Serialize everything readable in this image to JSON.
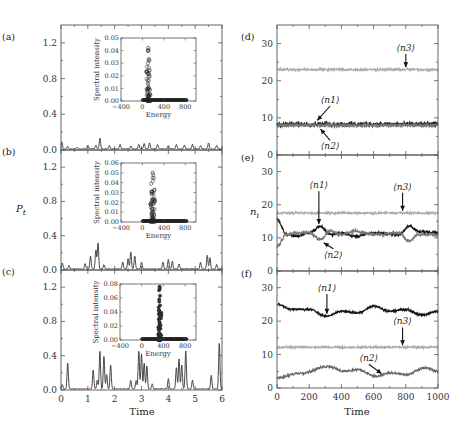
{
  "chart_data": [
    {
      "id": "a",
      "panel_label": "(a)",
      "type": "line",
      "xlabel": "",
      "ylabel": "P_t",
      "xlim": [
        0,
        6
      ],
      "ylim": [
        0,
        1.4
      ],
      "yticks": [
        0.0,
        0.4,
        0.8,
        1.2
      ],
      "xticks": [
        0,
        1,
        2,
        3,
        4,
        5,
        6
      ],
      "series": [
        {
          "name": "P_t",
          "color": "#333333",
          "peaks": [
            [
              0.03,
              0.08
            ],
            [
              0.25,
              0.03
            ],
            [
              0.6,
              0.02
            ],
            [
              1.0,
              0.04
            ],
            [
              1.3,
              0.04
            ],
            [
              1.45,
              0.12
            ],
            [
              1.8,
              0.04
            ],
            [
              2.2,
              0.05
            ],
            [
              2.6,
              0.03
            ],
            [
              2.9,
              0.05
            ],
            [
              3.1,
              0.06
            ],
            [
              3.3,
              0.07
            ],
            [
              3.6,
              0.05
            ],
            [
              4.0,
              0.04
            ],
            [
              4.3,
              0.05
            ],
            [
              4.6,
              0.04
            ],
            [
              4.9,
              0.05
            ],
            [
              5.2,
              0.04
            ],
            [
              5.5,
              0.07
            ],
            [
              5.8,
              0.04
            ]
          ]
        }
      ],
      "inset": {
        "xlabel": "Energy",
        "ylabel": "Spectral intensity",
        "xlim": [
          -400,
          1000
        ],
        "ylim": [
          0,
          0.05
        ],
        "xticks": [
          -400,
          0,
          400,
          800
        ],
        "xtick_labels": [
          "−400",
          "0",
          "400",
          "800"
        ],
        "yticks": [
          0.0,
          0.01,
          0.02,
          0.03,
          0.04,
          0.05
        ],
        "ytick_labels": [
          "0.00",
          "0.01",
          "0.02",
          "0.03",
          "0.04",
          "0.05"
        ],
        "marker": "open-circle",
        "center": 110,
        "spread": 60,
        "max": 0.042,
        "tail_to": 830
      }
    },
    {
      "id": "b",
      "panel_label": "(b)",
      "type": "line",
      "xlabel": "",
      "ylabel": "P_t",
      "xlim": [
        0,
        6
      ],
      "ylim": [
        0,
        1.4
      ],
      "yticks": [
        0.0,
        0.4,
        0.8,
        1.2
      ],
      "xticks": [
        0,
        1,
        2,
        3,
        4,
        5,
        6
      ],
      "series": [
        {
          "name": "P_t",
          "color": "#333333",
          "peaks": [
            [
              0.05,
              0.07
            ],
            [
              0.3,
              0.04
            ],
            [
              0.9,
              0.06
            ],
            [
              1.1,
              0.15
            ],
            [
              1.3,
              0.22
            ],
            [
              1.38,
              0.3
            ],
            [
              1.6,
              0.05
            ],
            [
              2.3,
              0.08
            ],
            [
              2.5,
              0.12
            ],
            [
              2.6,
              0.2
            ],
            [
              2.75,
              0.15
            ],
            [
              3.0,
              0.08
            ],
            [
              3.8,
              0.08
            ],
            [
              4.0,
              0.11
            ],
            [
              4.15,
              0.09
            ],
            [
              4.4,
              0.06
            ],
            [
              5.2,
              0.08
            ],
            [
              5.45,
              0.16
            ],
            [
              5.55,
              0.13
            ],
            [
              5.8,
              0.05
            ]
          ]
        }
      ],
      "inset": {
        "xlabel": "Energy",
        "ylabel": "Spectral intensity",
        "xlim": [
          -400,
          1000
        ],
        "ylim": [
          0,
          0.06
        ],
        "xticks": [
          -400,
          0,
          400,
          800
        ],
        "xtick_labels": [
          "−400",
          "0",
          "400",
          "800"
        ],
        "yticks": [
          0.0,
          0.01,
          0.02,
          0.03,
          0.04,
          0.05,
          0.06
        ],
        "ytick_labels": [
          "0.00",
          "0.01",
          "0.02",
          "0.03",
          "0.04",
          "0.05",
          "0.06"
        ],
        "marker": "open-circle",
        "center": 190,
        "spread": 60,
        "max": 0.05,
        "tail_to": 830
      }
    },
    {
      "id": "c",
      "panel_label": "(c)",
      "type": "line",
      "xlabel": "Time",
      "ylabel": "P_t",
      "xlim": [
        0,
        6
      ],
      "ylim": [
        0,
        1.4
      ],
      "yticks": [
        0.0,
        0.4,
        0.8,
        1.2
      ],
      "xticks": [
        0,
        1,
        2,
        3,
        4,
        5,
        6
      ],
      "series": [
        {
          "name": "P_t",
          "color": "#333333",
          "peaks": [
            [
              0.05,
              0.05
            ],
            [
              0.25,
              0.3
            ],
            [
              1.2,
              0.22
            ],
            [
              1.35,
              0.1
            ],
            [
              1.45,
              0.44
            ],
            [
              1.6,
              0.38
            ],
            [
              1.7,
              0.17
            ],
            [
              1.85,
              0.28
            ],
            [
              2.6,
              0.1
            ],
            [
              2.8,
              0.1
            ],
            [
              2.9,
              0.44
            ],
            [
              3.0,
              0.41
            ],
            [
              3.1,
              0.3
            ],
            [
              3.2,
              0.27
            ],
            [
              3.4,
              0.06
            ],
            [
              4.0,
              0.12
            ],
            [
              4.3,
              0.25
            ],
            [
              4.4,
              0.35
            ],
            [
              4.5,
              0.28
            ],
            [
              4.65,
              0.44
            ],
            [
              4.9,
              0.1
            ],
            [
              5.6,
              0.16
            ],
            [
              5.9,
              0.53
            ]
          ]
        }
      ],
      "inset": {
        "xlabel": "Energy",
        "ylabel": "Spectral intensity",
        "xlim": [
          -400,
          1000
        ],
        "ylim": [
          0,
          0.08
        ],
        "xticks": [
          -400,
          0,
          400,
          800
        ],
        "xtick_labels": [
          "−400",
          "0",
          "400",
          "800"
        ],
        "yticks": [
          0.0,
          0.02,
          0.04,
          0.06,
          0.08
        ],
        "ytick_labels": [
          "0.00",
          "0.02",
          "0.04",
          "0.06",
          "0.08"
        ],
        "marker": "filled-circle",
        "center": 330,
        "spread": 40,
        "max": 0.076,
        "tail_to": 830
      }
    },
    {
      "id": "d",
      "panel_label": "(d)",
      "type": "line",
      "xlabel": "",
      "ylabel": "n_i",
      "xlim": [
        0,
        1000
      ],
      "ylim": [
        0,
        35
      ],
      "yticks": [
        0,
        10,
        20,
        30
      ],
      "xticks": [
        0,
        200,
        400,
        600,
        800,
        1000
      ],
      "series": [
        {
          "name": "⟨n1⟩",
          "color": "#222222",
          "mean": 8.3,
          "noise": 1.0,
          "waves": []
        },
        {
          "name": "⟨n2⟩",
          "color": "#777777",
          "mean": 8.0,
          "noise": 0.8,
          "waves": []
        },
        {
          "name": "⟨n3⟩",
          "color": "#aaaaaa",
          "mean": 23.0,
          "noise": 0.5,
          "waves": []
        }
      ],
      "annotations": [
        {
          "text": "⟨n3⟩",
          "x": 800,
          "y": 28,
          "arrow_to": [
            800,
            23.6
          ]
        },
        {
          "text": "⟨n1⟩",
          "x": 330,
          "y": 14,
          "arrow_to": [
            250,
            9.3
          ]
        },
        {
          "text": "⟨n2⟩",
          "x": 330,
          "y": 1.5,
          "arrow_to": [
            270,
            7.0
          ]
        }
      ]
    },
    {
      "id": "e",
      "panel_label": "(e)",
      "type": "line",
      "xlabel": "",
      "ylabel": "n_i",
      "xlim": [
        0,
        1000
      ],
      "ylim": [
        0,
        35
      ],
      "yticks": [
        0,
        10,
        20,
        30
      ],
      "xticks": [
        0,
        200,
        400,
        600,
        800,
        1000
      ],
      "series": [
        {
          "name": "⟨n1⟩",
          "color": "#111111",
          "mean": 11.5,
          "noise": 0.7,
          "waves": [
            [
              0,
              15.5
            ],
            [
              60,
              11
            ],
            [
              120,
              10.5
            ],
            [
              200,
              11.5
            ],
            [
              270,
              13.5
            ],
            [
              330,
              11
            ],
            [
              400,
              11.5
            ],
            [
              480,
              10.5
            ],
            [
              600,
              11.5
            ],
            [
              760,
              11
            ],
            [
              820,
              13.5
            ],
            [
              880,
              12
            ],
            [
              1000,
              11.5
            ]
          ]
        },
        {
          "name": "⟨n2⟩",
          "color": "#777777",
          "mean": 11.0,
          "noise": 0.8,
          "waves": [
            [
              0,
              7.5
            ],
            [
              60,
              11
            ],
            [
              120,
              11.5
            ],
            [
              200,
              11.5
            ],
            [
              270,
              9.5
            ],
            [
              330,
              12
            ],
            [
              400,
              11
            ],
            [
              480,
              12
            ],
            [
              600,
              11
            ],
            [
              760,
              11.5
            ],
            [
              820,
              9
            ],
            [
              880,
              11
            ],
            [
              1000,
              11
            ]
          ]
        },
        {
          "name": "⟨n3⟩",
          "color": "#aaaaaa",
          "mean": 17.5,
          "noise": 0.5,
          "waves": []
        }
      ],
      "annotations": [
        {
          "text": "⟨n1⟩",
          "x": 260,
          "y": 25,
          "arrow_to": [
            260,
            14.2
          ]
        },
        {
          "text": "⟨n3⟩",
          "x": 780,
          "y": 24.5,
          "arrow_to": [
            780,
            18.2
          ]
        },
        {
          "text": "⟨n2⟩",
          "x": 350,
          "y": 4,
          "arrow_to": [
            290,
            8.5
          ]
        }
      ]
    },
    {
      "id": "f",
      "panel_label": "(f)",
      "type": "line",
      "xlabel": "Time",
      "ylabel": "n_i",
      "xlim": [
        0,
        1000
      ],
      "ylim": [
        0,
        35
      ],
      "yticks": [
        0,
        10,
        20,
        30
      ],
      "xticks": [
        0,
        200,
        400,
        600,
        800,
        1000
      ],
      "xtick_labels": [
        "0",
        "200",
        "400",
        "600",
        "800",
        "1000"
      ],
      "series": [
        {
          "name": "⟨n1⟩",
          "color": "#111111",
          "mean": 23,
          "noise": 0.5,
          "waves": [
            [
              0,
              25
            ],
            [
              100,
              23.5
            ],
            [
              200,
              23.5
            ],
            [
              310,
              21.5
            ],
            [
              400,
              23
            ],
            [
              500,
              22.5
            ],
            [
              600,
              24.5
            ],
            [
              700,
              23
            ],
            [
              800,
              23.5
            ],
            [
              900,
              21.8
            ],
            [
              1000,
              23
            ]
          ]
        },
        {
          "name": "⟨n2⟩",
          "color": "#666666",
          "mean": 5,
          "noise": 0.6,
          "waves": [
            [
              0,
              3
            ],
            [
              150,
              4.5
            ],
            [
              320,
              6.5
            ],
            [
              420,
              5
            ],
            [
              500,
              5.5
            ],
            [
              620,
              3.5
            ],
            [
              700,
              4.5
            ],
            [
              800,
              4
            ],
            [
              920,
              6
            ],
            [
              1000,
              5
            ]
          ]
        },
        {
          "name": "⟨n3⟩",
          "color": "#aaaaaa",
          "mean": 12.2,
          "noise": 0.5,
          "waves": []
        }
      ],
      "annotations": [
        {
          "text": "⟨n1⟩",
          "x": 310,
          "y": 29,
          "arrow_to": [
            310,
            22.2
          ]
        },
        {
          "text": "⟨n3⟩",
          "x": 780,
          "y": 19,
          "arrow_to": [
            780,
            12.8
          ]
        },
        {
          "text": "⟨n2⟩",
          "x": 570,
          "y": 8,
          "arrow_to": [
            650,
            4.3
          ]
        }
      ]
    }
  ],
  "labels": {
    "left_ylabel": "P",
    "left_ylabel_sub": "t",
    "right_ylabel": "n",
    "right_ylabel_sub": "i",
    "left_xlabel": "Time",
    "right_xlabel": "Time",
    "panel_a": "(a)",
    "panel_b": "(b)",
    "panel_c": "(c)",
    "panel_d": "(d)",
    "panel_e": "(e)",
    "panel_f": "(f)"
  }
}
